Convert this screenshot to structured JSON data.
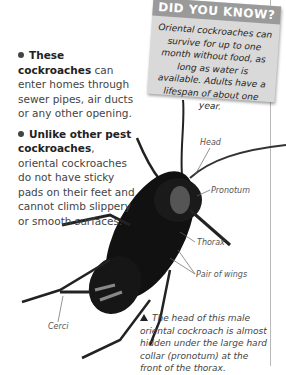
{
  "did_you_know": {
    "title": "DID YOU KNOW?",
    "text": "Oriental cockroaches can survive for up to one month without food, as long as water is available. Adults have a lifespan of about one year."
  },
  "bullets": [
    {
      "bold": "These cockroaches",
      "text": " can enter homes through sewer pipes, air ducts or any other opening."
    },
    {
      "bold": "Unlike other pest cockroaches",
      "text": ", oriental cockroaches do not have sticky pads on their feet and cannot climb slippery or smooth surfaces."
    }
  ],
  "labels": {
    "head": "Head",
    "pronotum": "Pronotum",
    "thorax": "Thorax",
    "wings": "Pair of wings",
    "cerci": "Cerci"
  },
  "caption": "The head of this male oriental cockroach is almost hidden under the large hard collar (pronotum) at the front of the thorax."
}
